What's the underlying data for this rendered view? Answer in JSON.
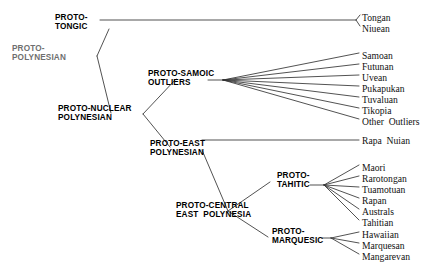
{
  "figure": {
    "width": 437,
    "height": 266,
    "background_color": "#ffffff",
    "line_color": "#333333"
  },
  "internal_nodes": [
    {
      "id": "proto-polynesian",
      "line1": "PROTO-",
      "line2": "POLYNESIAN",
      "x": 12,
      "y": 44,
      "faded": true
    },
    {
      "id": "proto-tongic",
      "line1": "PROTO-",
      "line2": "TONGIC",
      "x": 55,
      "y": 13,
      "faded": false
    },
    {
      "id": "proto-nuclear-polynesian",
      "line1": "PROTO-NUCLEAR",
      "line2": "POLYNESIAN",
      "x": 58,
      "y": 104,
      "faded": false
    },
    {
      "id": "proto-samoic-outliers",
      "line1": "PROTO-SAMOIC",
      "line2": "OUTLIERS",
      "x": 148,
      "y": 69,
      "faded": false
    },
    {
      "id": "proto-east-polynesian",
      "line1": "PROTO-EAST",
      "line2": "POLYNESIAN",
      "x": 150,
      "y": 139,
      "faded": false
    },
    {
      "id": "proto-central-east-polynesia",
      "line1": "PROTO-CENTRAL",
      "line2": "EAST  POLYNESIA",
      "x": 176,
      "y": 201,
      "faded": false
    },
    {
      "id": "proto-tahitic",
      "line1": "PROTO-",
      "line2": "TAHITIC",
      "x": 277,
      "y": 171,
      "faded": false
    },
    {
      "id": "proto-marquesic",
      "line1": "PROTO-",
      "line2": "MARQUESIC",
      "x": 272,
      "y": 227,
      "faded": false
    }
  ],
  "leaves": [
    {
      "id": "tongan",
      "label": "Tongan",
      "x": 362,
      "y": 13,
      "parent": "proto-tongic"
    },
    {
      "id": "niuean",
      "label": "Niuean",
      "x": 362,
      "y": 24,
      "parent": "proto-tongic"
    },
    {
      "id": "samoan",
      "label": "Samoan",
      "x": 362,
      "y": 51,
      "parent": "proto-samoic-outliers"
    },
    {
      "id": "futunan",
      "label": "Futunan",
      "x": 362,
      "y": 62,
      "parent": "proto-samoic-outliers"
    },
    {
      "id": "uvean",
      "label": "Uvean",
      "x": 362,
      "y": 73,
      "parent": "proto-samoic-outliers"
    },
    {
      "id": "pukapukan",
      "label": "Pukapukan",
      "x": 362,
      "y": 84,
      "parent": "proto-samoic-outliers"
    },
    {
      "id": "tuvaluan",
      "label": "Tuvaluan",
      "x": 362,
      "y": 95,
      "parent": "proto-samoic-outliers"
    },
    {
      "id": "tikopia",
      "label": "Tikopia",
      "x": 362,
      "y": 106,
      "parent": "proto-samoic-outliers"
    },
    {
      "id": "other-outliers",
      "label": "Other  Outliers",
      "x": 362,
      "y": 117,
      "parent": "proto-samoic-outliers"
    },
    {
      "id": "rapa-nuian",
      "label": "Rapa  Nuian",
      "x": 362,
      "y": 136,
      "parent": "proto-east-polynesian"
    },
    {
      "id": "maori",
      "label": "Maori",
      "x": 362,
      "y": 163,
      "parent": "proto-tahitic"
    },
    {
      "id": "rarotongan",
      "label": "Rarotongan",
      "x": 362,
      "y": 174,
      "parent": "proto-tahitic"
    },
    {
      "id": "tuamotuan",
      "label": "Tuamotuan",
      "x": 362,
      "y": 185,
      "parent": "proto-tahitic"
    },
    {
      "id": "rapan",
      "label": "Rapan",
      "x": 362,
      "y": 196,
      "parent": "proto-tahitic"
    },
    {
      "id": "australs",
      "label": "Australs",
      "x": 362,
      "y": 207,
      "parent": "proto-tahitic"
    },
    {
      "id": "tahitian",
      "label": "Tahitian",
      "x": 362,
      "y": 218,
      "parent": "proto-tahitic"
    },
    {
      "id": "hawaiian",
      "label": "Hawaiian",
      "x": 362,
      "y": 230,
      "parent": "proto-marquesic"
    },
    {
      "id": "marquesan",
      "label": "Marquesan",
      "x": 362,
      "y": 241,
      "parent": "proto-marquesic"
    },
    {
      "id": "mangarevan",
      "label": "Mangarevan",
      "x": 362,
      "y": 252,
      "parent": "proto-marquesic"
    }
  ],
  "branches": [
    {
      "id": "root-to-tongic",
      "x1": 97,
      "y1": 56,
      "x2": 109,
      "y2": 29
    },
    {
      "id": "root-to-nuclear",
      "x1": 97,
      "y1": 56,
      "x2": 111,
      "y2": 113
    },
    {
      "id": "tongic-stem",
      "x1": 100,
      "y1": 20,
      "x2": 356,
      "y2": 20
    },
    {
      "id": "tongic-to-tongan",
      "x1": 356,
      "y1": 20,
      "x2": 360,
      "y2": 15
    },
    {
      "id": "tongic-to-niuean",
      "x1": 356,
      "y1": 20,
      "x2": 360,
      "y2": 26
    },
    {
      "id": "nuclear-to-samoic",
      "x1": 143,
      "y1": 114,
      "x2": 176,
      "y2": 79
    },
    {
      "id": "nuclear-to-east",
      "x1": 143,
      "y1": 114,
      "x2": 170,
      "y2": 147
    },
    {
      "id": "samoic-stem",
      "x1": 208,
      "y1": 80,
      "x2": 223,
      "y2": 80
    },
    {
      "id": "samoic-to-samoan",
      "x1": 223,
      "y1": 80,
      "x2": 359,
      "y2": 53
    },
    {
      "id": "samoic-to-futunan",
      "x1": 223,
      "y1": 80,
      "x2": 359,
      "y2": 64
    },
    {
      "id": "samoic-to-uvean",
      "x1": 223,
      "y1": 80,
      "x2": 359,
      "y2": 75
    },
    {
      "id": "samoic-to-pukapukan",
      "x1": 223,
      "y1": 80,
      "x2": 359,
      "y2": 86
    },
    {
      "id": "samoic-to-tuvaluan",
      "x1": 223,
      "y1": 80,
      "x2": 359,
      "y2": 97
    },
    {
      "id": "samoic-to-tikopia",
      "x1": 223,
      "y1": 80,
      "x2": 359,
      "y2": 108
    },
    {
      "id": "samoic-to-other-outliers",
      "x1": 223,
      "y1": 80,
      "x2": 359,
      "y2": 119
    },
    {
      "id": "east-stem-to-rapa-nuian",
      "x1": 202,
      "y1": 140,
      "x2": 359,
      "y2": 140
    },
    {
      "id": "east-to-central",
      "x1": 202,
      "y1": 150,
      "x2": 228,
      "y2": 211
    },
    {
      "id": "central-to-tahitic",
      "x1": 228,
      "y1": 211,
      "x2": 270,
      "y2": 182
    },
    {
      "id": "central-to-marquesic",
      "x1": 228,
      "y1": 211,
      "x2": 268,
      "y2": 237
    },
    {
      "id": "tahitic-stem",
      "x1": 310,
      "y1": 185,
      "x2": 324,
      "y2": 185
    },
    {
      "id": "tahitic-to-maori",
      "x1": 324,
      "y1": 185,
      "x2": 359,
      "y2": 165
    },
    {
      "id": "tahitic-to-rarotongan",
      "x1": 324,
      "y1": 185,
      "x2": 359,
      "y2": 176
    },
    {
      "id": "tahitic-to-tuamotuan",
      "x1": 324,
      "y1": 185,
      "x2": 359,
      "y2": 187
    },
    {
      "id": "tahitic-to-rapan",
      "x1": 324,
      "y1": 185,
      "x2": 359,
      "y2": 198
    },
    {
      "id": "tahitic-to-australs",
      "x1": 324,
      "y1": 185,
      "x2": 359,
      "y2": 209
    },
    {
      "id": "tahitic-to-tahitian",
      "x1": 324,
      "y1": 185,
      "x2": 359,
      "y2": 220
    },
    {
      "id": "marquesic-stem",
      "x1": 322,
      "y1": 238,
      "x2": 331,
      "y2": 238
    },
    {
      "id": "marquesic-to-hawaiian",
      "x1": 331,
      "y1": 238,
      "x2": 359,
      "y2": 232
    },
    {
      "id": "marquesic-to-marquesan",
      "x1": 331,
      "y1": 238,
      "x2": 359,
      "y2": 243
    },
    {
      "id": "marquesic-to-mangarevan",
      "x1": 331,
      "y1": 238,
      "x2": 359,
      "y2": 254
    }
  ]
}
